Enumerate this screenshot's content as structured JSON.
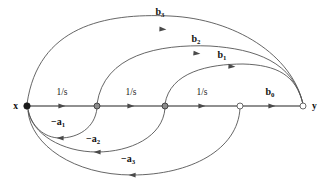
{
  "figure": {
    "type": "signal-flow-graph",
    "background_color": "#ffffff",
    "edge_color": "#555555",
    "axis_color": "#6b6b6b",
    "label_color": "#111111"
  },
  "nodes": [
    {
      "id": "x",
      "label": "x",
      "x": 27,
      "y": 106,
      "style": "filled",
      "label_dx": -9,
      "label_dy": 3
    },
    {
      "id": "n1",
      "label": "",
      "x": 97,
      "y": 106,
      "style": "half",
      "label_dx": 0,
      "label_dy": 0
    },
    {
      "id": "n2",
      "label": "",
      "x": 165,
      "y": 106,
      "style": "half",
      "label_dx": 0,
      "label_dy": 0
    },
    {
      "id": "n3",
      "label": "",
      "x": 240,
      "y": 106,
      "style": "open",
      "label_dx": 0,
      "label_dy": 0
    },
    {
      "id": "y",
      "label": "y",
      "x": 303,
      "y": 106,
      "style": "open",
      "label_dx": 9,
      "label_dy": 3
    }
  ],
  "forward_path": {
    "gain_labels": [
      {
        "text": "1/s",
        "x": 62,
        "y": 95
      },
      {
        "text": "1/s",
        "x": 131,
        "y": 95
      },
      {
        "text": "1/s",
        "x": 202,
        "y": 95
      }
    ],
    "output_gain": {
      "base": "b",
      "sub": "0",
      "x": 270,
      "y": 95
    },
    "arrow_positions": [
      {
        "x": 62,
        "y": 106
      },
      {
        "x": 131,
        "y": 106
      },
      {
        "x": 202,
        "y": 106
      },
      {
        "x": 272,
        "y": 106
      }
    ]
  },
  "feedforward_arcs": [
    {
      "name": "b3",
      "base": "b",
      "sub": "3",
      "from": "x",
      "to": "y",
      "label": {
        "x": 160,
        "y": 15
      },
      "path": "M 27 104 C 38 26 105 13 170 16 C 235 19 292 55 303 104",
      "arrow": {
        "x": 163,
        "y": 29.2,
        "angle": 3
      }
    },
    {
      "name": "b2",
      "base": "b",
      "sub": "2",
      "from": "n1",
      "to": "y",
      "label": {
        "x": 196,
        "y": 42
      },
      "path": "M 97 104 C 104 55 158 44 210 46 C 256 49 293 62 303 104",
      "arrow": {
        "x": 197,
        "y": 53.5,
        "angle": 5
      }
    },
    {
      "name": "b1",
      "base": "b",
      "sub": "1",
      "from": "n2",
      "to": "y",
      "label": {
        "x": 222,
        "y": 58
      },
      "path": "M 165 104 C 170 72 209 64 243 64 C 277 65 296 75 303 104",
      "arrow": {
        "x": 232,
        "y": 66.5,
        "angle": 4
      }
    }
  ],
  "feedback_arcs": [
    {
      "name": "-a1",
      "base": "a",
      "sub": "1",
      "sign": "−",
      "from": "n1",
      "to": "x",
      "label": {
        "x": 58,
        "y": 125
      },
      "path": "M 97 108 C 95 128 78 138 60 138 C 44 138 31 126 28 109",
      "arrow": {
        "x": 60,
        "y": 138,
        "angle": 181
      }
    },
    {
      "name": "-a2",
      "base": "a",
      "sub": "2",
      "sign": "−",
      "from": "n2",
      "to": "x",
      "label": {
        "x": 93,
        "y": 142
      },
      "path": "M 165 108 C 163 137 130 152 97 152 C 62 152 32 134 28 110",
      "arrow": {
        "x": 97,
        "y": 152,
        "angle": 181
      }
    },
    {
      "name": "-a3",
      "base": "a",
      "sub": "3",
      "sign": "−",
      "from": "n3",
      "to": "x",
      "label": {
        "x": 128,
        "y": 162
      },
      "path": "M 240 108 C 238 150 190 175 132 175 C 74 175 31 145 28 111",
      "arrow": {
        "x": 132,
        "y": 175,
        "angle": 181
      }
    }
  ]
}
